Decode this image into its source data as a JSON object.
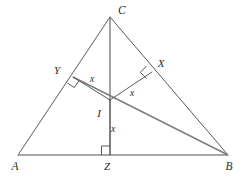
{
  "figure": {
    "type": "geometry-diagram",
    "background_color": "#ffffff",
    "stroke_color": "#5a5a5a",
    "base_stroke_color": "#8a8a8a",
    "label_color": "#2b2b2b"
  },
  "vertices": [
    {
      "id": "A",
      "label": "A",
      "x": 18,
      "y": 155,
      "label_x": 15,
      "label_y": 170
    },
    {
      "id": "B",
      "label": "B",
      "x": 228,
      "y": 155,
      "label_x": 229,
      "label_y": 170
    },
    {
      "id": "C",
      "label": "C",
      "x": 110,
      "y": 17,
      "label_x": 118,
      "label_y": 14
    }
  ],
  "points": [
    {
      "id": "I",
      "label": "I",
      "x": 110,
      "y": 100,
      "label_x": 99,
      "label_y": 117
    },
    {
      "id": "X",
      "label": "X",
      "x": 152,
      "y": 72,
      "label_x": 161,
      "label_y": 67
    },
    {
      "id": "Y",
      "label": "Y",
      "x": 73,
      "y": 77,
      "label_x": 57,
      "label_y": 74
    },
    {
      "id": "Z",
      "label": "Z",
      "x": 110,
      "y": 155,
      "label_x": 107,
      "label_y": 170
    }
  ],
  "edges": [
    {
      "id": "AB",
      "from": "A",
      "to": "B",
      "style": "base"
    },
    {
      "id": "AC",
      "from": "A",
      "to": "C",
      "style": "side"
    },
    {
      "id": "CB",
      "from": "C",
      "to": "B",
      "style": "side"
    }
  ],
  "cevians": [
    {
      "id": "CZ",
      "from": "C",
      "to": "Z",
      "note": "vertical line from apex C through I to base point Z"
    },
    {
      "id": "AI-ext",
      "from": "A",
      "to": "B",
      "via": "I",
      "note": "line from near A through I down to B"
    }
  ],
  "inradii": [
    {
      "id": "IY",
      "from": "I",
      "to": "Y",
      "length_label": "x",
      "label_x": 92,
      "label_y": 82
    },
    {
      "id": "IX",
      "from": "I",
      "to": "X",
      "length_label": "x",
      "label_x": 132,
      "label_y": 96
    },
    {
      "id": "IZ",
      "from": "I",
      "to": "Z",
      "length_label": "x",
      "label_x": 113,
      "label_y": 132
    }
  ],
  "right_angles": [
    {
      "id": "right-angle-at-Y",
      "at": "Y",
      "size": 9
    },
    {
      "id": "right-angle-at-X",
      "at": "X",
      "size": 9
    },
    {
      "id": "right-angle-at-Z",
      "at": "Z",
      "size": 9
    }
  ],
  "labels": {
    "equal_length_symbol": "x"
  }
}
